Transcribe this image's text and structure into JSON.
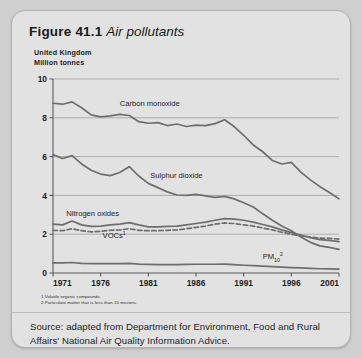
{
  "figure": {
    "number": "Figure 41.1",
    "caption": "Air pollutants",
    "region": "United Kingdom",
    "units": "Million tonnes"
  },
  "footnotes": [
    "1 Volatile organic compounds.",
    "2 Particulate matter that is less than 10 microns."
  ],
  "source": "Source: adapted from Department for Environment, Food and Rural Affairs' National Air Quality Information Advice.",
  "colors": {
    "card_background": "#e2e2e2",
    "page_background": "#cfcfcf",
    "line": "#6e6e6e",
    "gridline": "#a9a9a9",
    "axis": "#5a5a5a",
    "text": "#1d1d1d"
  },
  "chart_data": {
    "type": "line",
    "title": "Air pollutants",
    "subtitle": "United Kingdom, Million tonnes",
    "xlabel": "",
    "ylabel": "Million tonnes",
    "xlim": [
      1971,
      2001
    ],
    "ylim": [
      0,
      10
    ],
    "yticks": [
      0,
      2,
      4,
      6,
      8,
      10
    ],
    "xticks": [
      1971,
      1976,
      1981,
      1986,
      1991,
      1996,
      2001
    ],
    "grid": "horizontal",
    "legend": "inline-labels",
    "x": [
      1971,
      1972,
      1973,
      1974,
      1975,
      1976,
      1977,
      1978,
      1979,
      1980,
      1981,
      1982,
      1983,
      1984,
      1985,
      1986,
      1987,
      1988,
      1989,
      1990,
      1991,
      1992,
      1993,
      1994,
      1995,
      1996,
      1997,
      1998,
      1999,
      2000,
      2001
    ],
    "series": [
      {
        "name": "Carbon monoxide",
        "label": "Carbon monoxide",
        "style": "solid",
        "label_x": 1978.0,
        "label_y": 8.62,
        "values": [
          8.75,
          8.7,
          8.82,
          8.52,
          8.15,
          8.05,
          8.1,
          8.18,
          8.12,
          7.8,
          7.72,
          7.75,
          7.6,
          7.68,
          7.55,
          7.62,
          7.6,
          7.7,
          7.9,
          7.55,
          7.1,
          6.6,
          6.25,
          5.8,
          5.62,
          5.7,
          5.2,
          4.8,
          4.45,
          4.15,
          3.82
        ]
      },
      {
        "name": "Sulphur dioxide",
        "label": "Sulphur dioxide",
        "style": "solid",
        "label_x": 1981.2,
        "label_y": 4.92,
        "values": [
          6.1,
          5.9,
          6.05,
          5.62,
          5.3,
          5.1,
          5.02,
          5.18,
          5.48,
          5.0,
          4.62,
          4.4,
          4.18,
          4.02,
          4.0,
          4.05,
          3.98,
          3.9,
          3.95,
          3.82,
          3.62,
          3.4,
          3.05,
          2.72,
          2.42,
          2.18,
          1.85,
          1.58,
          1.4,
          1.32,
          1.22
        ]
      },
      {
        "name": "Nitrogen oxides",
        "label": "Nitrogen oxides",
        "style": "solid",
        "label_x": 1972.4,
        "label_y": 2.92,
        "values": [
          2.52,
          2.48,
          2.68,
          2.48,
          2.4,
          2.42,
          2.48,
          2.52,
          2.6,
          2.48,
          2.38,
          2.38,
          2.4,
          2.42,
          2.48,
          2.55,
          2.62,
          2.72,
          2.8,
          2.78,
          2.72,
          2.62,
          2.5,
          2.38,
          2.22,
          2.08,
          1.95,
          1.82,
          1.72,
          1.68,
          1.62
        ]
      },
      {
        "name": "VOCs",
        "label": "VOCs¹",
        "style": "dashed",
        "label_x": 1976.2,
        "label_y": 1.8,
        "values": [
          2.2,
          2.18,
          2.28,
          2.18,
          2.12,
          2.15,
          2.2,
          2.22,
          2.28,
          2.2,
          2.18,
          2.18,
          2.2,
          2.22,
          2.28,
          2.35,
          2.42,
          2.52,
          2.58,
          2.55,
          2.48,
          2.42,
          2.32,
          2.22,
          2.1,
          2.0,
          1.92,
          1.85,
          1.8,
          1.78,
          1.75
        ]
      },
      {
        "name": "PM10",
        "label": "PM₁₀²",
        "style": "solid",
        "label_x": 1993.0,
        "label_y": 0.72,
        "values": [
          0.52,
          0.52,
          0.54,
          0.5,
          0.48,
          0.48,
          0.48,
          0.48,
          0.5,
          0.46,
          0.44,
          0.43,
          0.43,
          0.43,
          0.44,
          0.45,
          0.45,
          0.45,
          0.46,
          0.43,
          0.4,
          0.38,
          0.35,
          0.33,
          0.3,
          0.28,
          0.26,
          0.24,
          0.22,
          0.21,
          0.2
        ]
      }
    ]
  }
}
